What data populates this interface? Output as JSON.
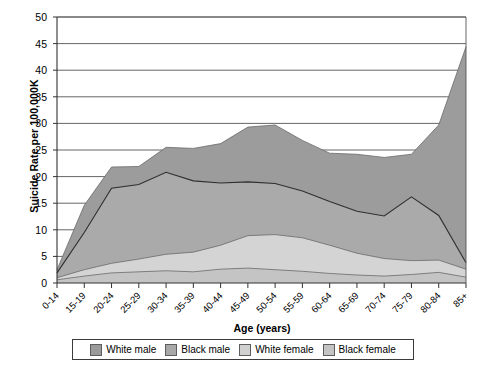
{
  "chart_data": {
    "type": "area",
    "stacked": true,
    "title": "",
    "xlabel": "Age (years)",
    "ylabel": "Suicide Rate per 100,000K",
    "categories": [
      "0-14",
      "15-19",
      "20-24",
      "25-29",
      "30-34",
      "35-39",
      "40-44",
      "45-49",
      "50-54",
      "55-59",
      "60-64",
      "65-69",
      "70-74",
      "75-79",
      "80-84",
      "85+"
    ],
    "ylim": [
      0,
      50
    ],
    "ytick_values": [
      0,
      5,
      10,
      15,
      20,
      25,
      30,
      35,
      40,
      45,
      50
    ],
    "grid": true,
    "legend_position": "bottom",
    "series": [
      {
        "name": "Black female",
        "color": "#c9c9c9",
        "values": [
          0.6,
          1.3,
          1.9,
          2.1,
          2.3,
          2.1,
          2.6,
          2.8,
          2.5,
          2.2,
          1.8,
          1.5,
          1.3,
          1.6,
          2.0,
          1.1
        ]
      },
      {
        "name": "White female",
        "color": "#d0d0d0",
        "values": [
          0.4,
          1.2,
          1.8,
          2.4,
          3.1,
          3.7,
          4.5,
          6.1,
          6.6,
          6.3,
          5.3,
          4.1,
          3.3,
          2.6,
          2.3,
          1.5
        ]
      },
      {
        "name": "Black male",
        "color": "#a8a8a8",
        "values": [
          0.9,
          7.0,
          14.1,
          14.0,
          15.4,
          13.4,
          11.7,
          10.1,
          9.6,
          8.8,
          8.2,
          7.9,
          8.0,
          12.0,
          8.4,
          1.2
        ]
      },
      {
        "name": "White male",
        "color": "#9a9a9a",
        "values": [
          0.6,
          5.1,
          6.0,
          5.4,
          4.7,
          6.1,
          7.4,
          10.3,
          11.0,
          9.5,
          9.1,
          10.7,
          11.0,
          8.0,
          17.0,
          40.6
        ]
      }
    ],
    "stack_tops": {
      "black_female": [
        0.6,
        1.3,
        1.9,
        2.1,
        2.3,
        2.1,
        2.6,
        2.8,
        2.5,
        2.2,
        1.8,
        1.5,
        1.3,
        1.6,
        2.0,
        1.1
      ],
      "white_female": [
        1.0,
        2.5,
        3.7,
        4.5,
        5.4,
        5.8,
        7.1,
        8.9,
        9.1,
        8.5,
        7.1,
        5.6,
        4.6,
        4.2,
        4.3,
        2.6
      ],
      "black_male": [
        1.9,
        9.5,
        17.8,
        18.5,
        20.8,
        19.2,
        18.8,
        19.0,
        18.7,
        17.3,
        15.3,
        13.5,
        12.6,
        16.2,
        12.7,
        3.8
      ],
      "white_male": [
        2.5,
        14.6,
        21.8,
        21.9,
        25.5,
        25.3,
        26.2,
        29.3,
        29.7,
        26.8,
        24.4,
        24.2,
        23.6,
        24.2,
        29.7,
        44.4
      ]
    },
    "annotations": {
      "notable_points": [
        {
          "label": "Black male peak at 30-34",
          "value": 15.4
        },
        {
          "label": "Black male secondary peak at 75-79",
          "value": 12.0
        },
        {
          "label": "White male total peak at 85+",
          "value": 44.4
        }
      ]
    }
  },
  "legend": {
    "items": [
      {
        "label": "White male",
        "color": "#9a9a9a"
      },
      {
        "label": "Black male",
        "color": "#a8a8a8"
      },
      {
        "label": "White female",
        "color": "#d0d0d0"
      },
      {
        "label": "Black female",
        "color": "#c4c4c4"
      }
    ]
  }
}
